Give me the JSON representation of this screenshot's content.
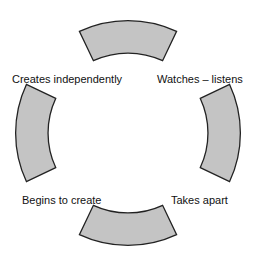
{
  "diagram": {
    "type": "cycle",
    "fill_color": "#c4c4c4",
    "stroke_color": "#222222",
    "segments": [
      {
        "position": "top"
      },
      {
        "position": "right"
      },
      {
        "position": "bottom"
      },
      {
        "position": "left"
      }
    ],
    "labels": [
      {
        "text": "Watches – listens",
        "position": "top-right"
      },
      {
        "text": "Takes apart",
        "position": "bottom-right"
      },
      {
        "text": "Begins to create",
        "position": "bottom-left"
      },
      {
        "text": "Creates independently",
        "position": "top-left"
      }
    ]
  }
}
